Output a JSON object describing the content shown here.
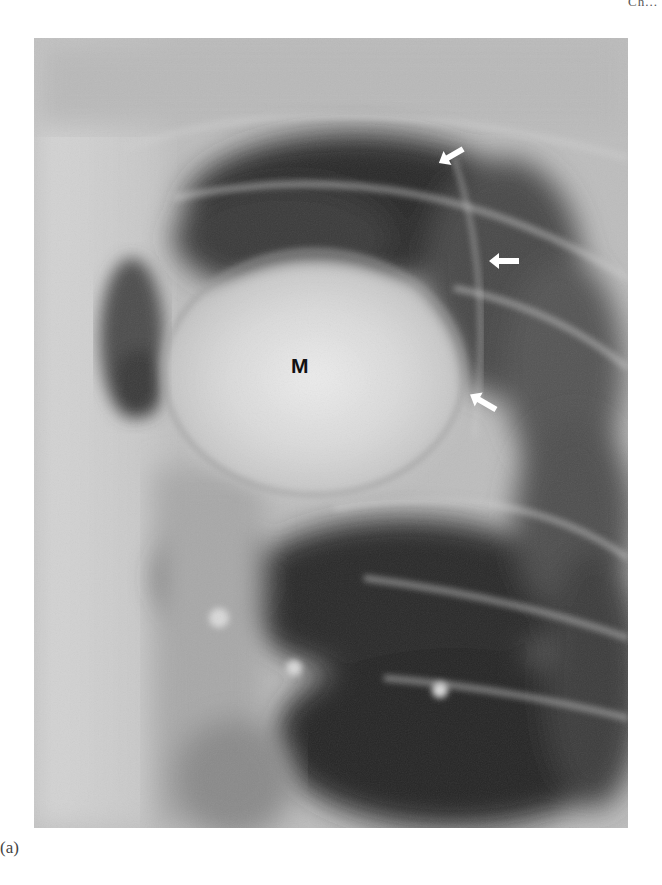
{
  "page": {
    "header_fragment": "Ch..."
  },
  "figure": {
    "type": "radiograph",
    "view": "lateral chest radiograph",
    "labels": [
      {
        "text": "M",
        "meaning": "mass"
      }
    ],
    "arrows": [
      {
        "id": 1,
        "direction": "down-left",
        "color": "#ffffff"
      },
      {
        "id": 2,
        "direction": "left",
        "color": "#ffffff"
      },
      {
        "id": 3,
        "direction": "up-left",
        "color": "#ffffff"
      }
    ],
    "caption": "(a)"
  }
}
